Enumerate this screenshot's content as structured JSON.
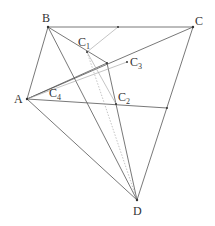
{
  "diagram": {
    "type": "geometry",
    "points": {
      "A": {
        "label": "A",
        "x": 27,
        "y": 99
      },
      "B": {
        "label": "B",
        "x": 48,
        "y": 27
      },
      "C": {
        "label": "C",
        "x": 193,
        "y": 27
      },
      "D": {
        "label": "D",
        "x": 137,
        "y": 200
      },
      "C1": {
        "label": "C",
        "sub": "1",
        "x": 87,
        "y": 52
      },
      "C2": {
        "label": "C",
        "sub": "2",
        "x": 116,
        "y": 104
      },
      "C3": {
        "label": "C",
        "sub": "3",
        "x": 127,
        "y": 62
      },
      "C4": {
        "label": "C",
        "sub": "4",
        "x": 80,
        "y": 95
      }
    },
    "labels": {
      "A": "A",
      "B": "B",
      "C": "C",
      "D": "D",
      "C1_main": "C",
      "C1_sub": "1",
      "C2_main": "C",
      "C2_sub": "2",
      "C3_main": "C",
      "C3_sub": "3",
      "C4_main": "C",
      "C4_sub": "4"
    },
    "line_color": "#555555",
    "light_line_color": "#aaaaaa"
  }
}
